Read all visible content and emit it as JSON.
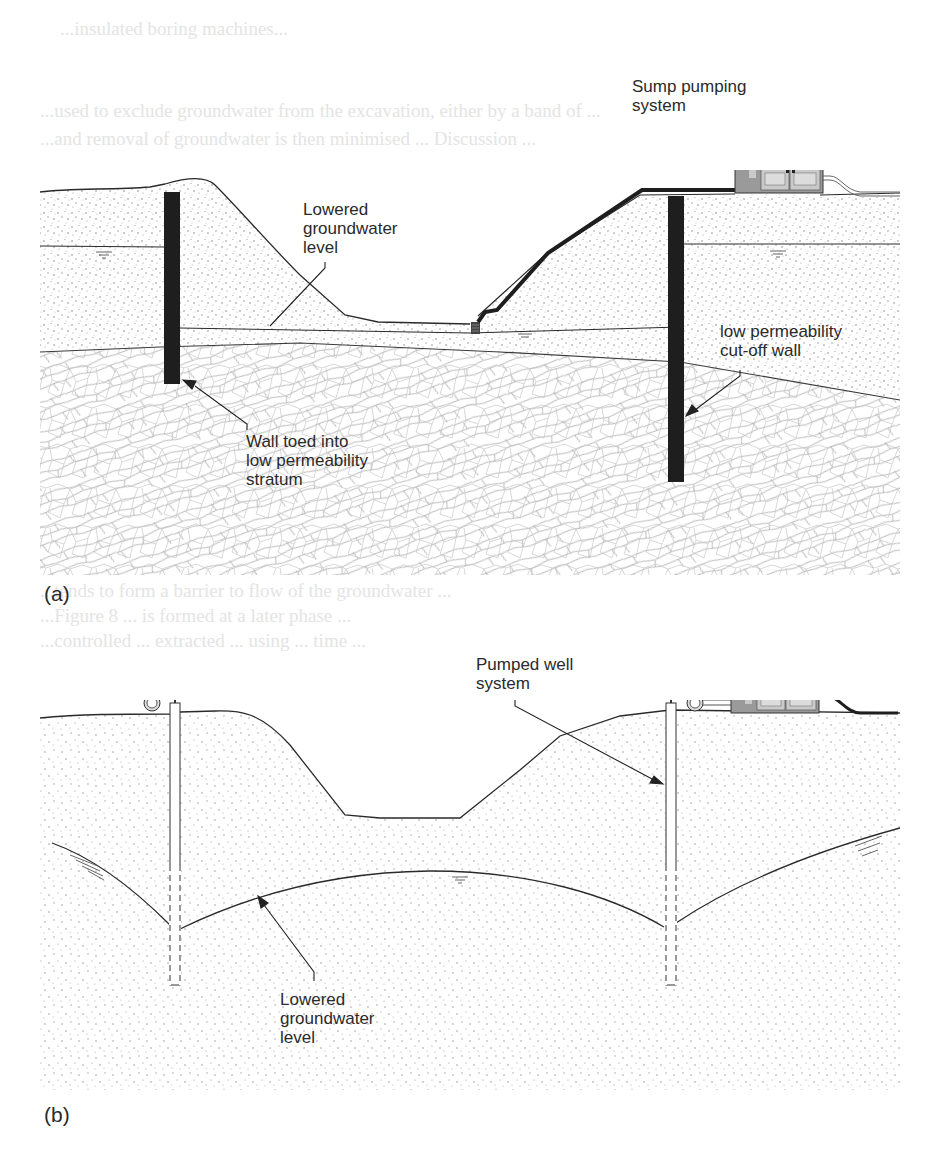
{
  "figure": {
    "panels": [
      {
        "id": "a",
        "label": "(a)",
        "annotations": {
          "sump": "Sump pumping\nsystem",
          "lowered_level": "Lowered\ngroundwater\nlevel",
          "cutoff_wall": "low permeability\ncut-off wall",
          "wall_toed": "Wall toed into\nlow permeability\nstratum"
        }
      },
      {
        "id": "b",
        "label": "(b)",
        "annotations": {
          "pumped_well": "Pumped well\nsystem",
          "lowered_level": "Lowered\ngroundwater\nlevel"
        }
      }
    ],
    "colors": {
      "ink": "#2a2a2a",
      "sand_dot": "#8a8a8a",
      "wall": "#1e1e1e",
      "stratum_line": "#b5b5b5",
      "pump_body": "#9a9a9a",
      "pump_roof": "#4a4a4a",
      "pump_panel": "#c9c9c9"
    }
  },
  "bleed_through": [
    "...insulated boring machines...",
    "...used to exclude groundwater from the excavation, either by a band of ...",
    "...and removal of groundwater is then minimised ... Discussion ...",
    "...tends to form a barrier to flow of the groundwater ...",
    "...Figure 8 ... is formed at a later phase ...",
    "...controlled ... extracted ... using ... time ..."
  ]
}
